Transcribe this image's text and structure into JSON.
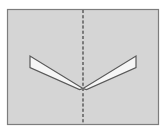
{
  "figure": {
    "title": "Symmetric chevron figure with vertical dashed axis of symmetry",
    "canvas": {
      "width": 166,
      "height": 132,
      "background": "#ffffff"
    },
    "panel": {
      "name": "diagram-panel",
      "x": 7.5,
      "y": 9.5,
      "width": 151,
      "height": 115,
      "fill": "#d5d5d5",
      "stroke": "#7d7d7d",
      "stroke_width": 1.2
    },
    "symmetry_axis": {
      "name": "axis-of-symmetry",
      "label": "vertical dashed line of symmetry",
      "x": 83,
      "y_start": 10,
      "y_end": 124,
      "stroke": "#6f6f6f",
      "stroke_width": 1.3,
      "dash_pattern": "3,2.2"
    },
    "shapes": [
      {
        "name": "left-wing",
        "label": "left chevron wing",
        "points": "30,56 30,67.5 79.5,89.5 83,88.5",
        "fill": "#f6f6f6",
        "stroke": "#5a5a5a",
        "stroke_width": 1.2
      },
      {
        "name": "right-wing",
        "label": "right chevron wing",
        "points": "136,56 136,67.5 86.5,89.5 83,88.5",
        "fill": "#f6f6f6",
        "stroke": "#5a5a5a",
        "stroke_width": 1.2
      }
    ],
    "vertices": {
      "left_outer_top": [
        30,
        56
      ],
      "left_outer_bottom": [
        30,
        67.5
      ],
      "right_outer_top": [
        136,
        56
      ],
      "right_outer_bottom": [
        136,
        67.5
      ],
      "center_apex": [
        83,
        88.5
      ]
    },
    "colors": {
      "panel_fill": "#d5d5d5",
      "panel_border": "#7d7d7d",
      "wing_fill": "#f6f6f6",
      "wing_stroke": "#5a5a5a",
      "axis_stroke": "#6f6f6f",
      "page_background": "#ffffff"
    }
  }
}
